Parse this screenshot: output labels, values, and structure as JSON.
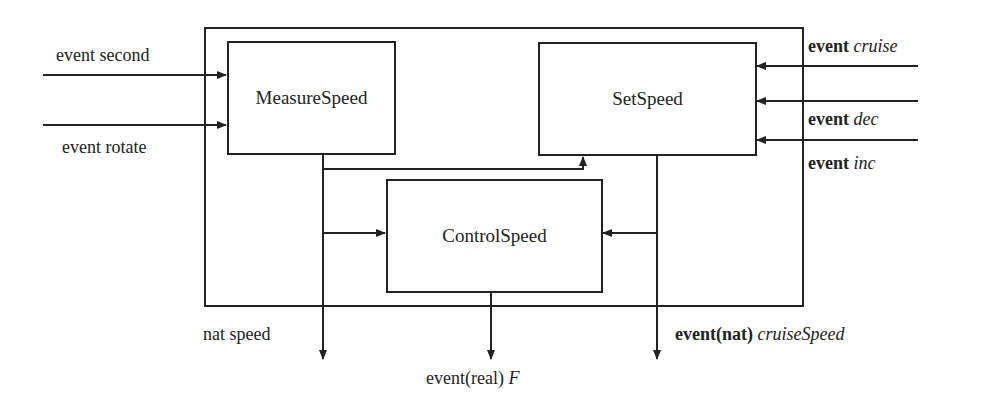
{
  "diagram": {
    "outer_block": {
      "name": "speed-controller-system"
    },
    "blocks": {
      "measure": {
        "label": "MeasureSpeed"
      },
      "set": {
        "label": "SetSpeed"
      },
      "control": {
        "label": "ControlSpeed"
      }
    },
    "inputs_left": [
      {
        "label": "event second"
      },
      {
        "label": "event rotate"
      }
    ],
    "inputs_right": [
      {
        "prefix": "event",
        "name": "cruise"
      },
      {
        "prefix": "event",
        "name": "dec"
      },
      {
        "prefix": "event",
        "name": "inc"
      }
    ],
    "outputs": {
      "speed": {
        "label": "nat speed"
      },
      "control": {
        "prefix": "event(real)",
        "name": "F"
      },
      "cruise": {
        "prefix": "event(nat)",
        "name": "cruiseSpeed"
      }
    },
    "colors": {
      "line": "#222222",
      "background": "#ffffff"
    }
  }
}
